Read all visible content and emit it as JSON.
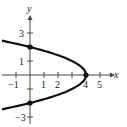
{
  "chart_data": {
    "type": "line",
    "title": "",
    "xlabel": "x",
    "ylabel": "y",
    "equation_implied": "x = 4 - y^2",
    "xlim": [
      -1,
      5
    ],
    "ylim": [
      -3,
      3
    ],
    "x_ticks": [
      "-1",
      "1",
      "2",
      "4",
      "5"
    ],
    "y_ticks": [
      "3",
      "1",
      "-3"
    ],
    "grid": false,
    "series": [
      {
        "name": "parabola",
        "points": [
          [
            -2.5,
            2.5
          ],
          [
            0,
            2
          ],
          [
            1.75,
            1.5
          ],
          [
            3,
            1
          ],
          [
            3.75,
            0.5
          ],
          [
            4,
            0
          ],
          [
            3.75,
            -0.5
          ],
          [
            3,
            -1
          ],
          [
            1.75,
            -1.5
          ],
          [
            0,
            -2
          ],
          [
            -2.5,
            -2.5
          ]
        ]
      }
    ],
    "marked_points": [
      {
        "x": 0,
        "y": 2
      },
      {
        "x": 4,
        "y": 0
      },
      {
        "x": 0,
        "y": -2
      }
    ]
  },
  "axes": {
    "x_label": "x",
    "y_label": "y",
    "x_tick_labels": [
      {
        "text": "-1",
        "value": -1
      },
      {
        "text": "1",
        "value": 1
      },
      {
        "text": "2",
        "value": 2
      },
      {
        "text": "4",
        "value": 4
      },
      {
        "text": "5",
        "value": 5
      }
    ],
    "y_tick_labels": [
      {
        "text": "3",
        "value": 3
      },
      {
        "text": "1",
        "value": 1
      },
      {
        "text": "-3",
        "value": -3
      }
    ]
  }
}
